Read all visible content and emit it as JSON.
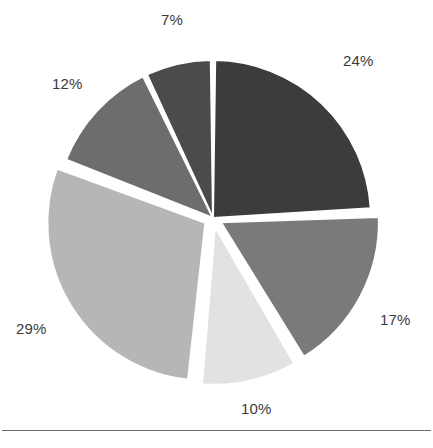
{
  "chart_data": {
    "type": "pie",
    "title": "",
    "subtitle": "",
    "xlabel": "",
    "ylabel": "",
    "legend_position": "none",
    "grid": false,
    "labels_shown": "percent",
    "categories": [
      "24%",
      "17%",
      "10%",
      "29%",
      "12%",
      "7%"
    ],
    "values": [
      24,
      17,
      10,
      29,
      12,
      7
    ],
    "total": 99,
    "start_angle_deg": 0,
    "direction": "clockwise",
    "slices": [
      {
        "index": 0,
        "label": "24%",
        "value": 24,
        "color": "#3c3c3c",
        "exploded": false,
        "start_deg": 0,
        "end_deg": 87.3,
        "label_x": 343,
        "label_y": 52
      },
      {
        "index": 1,
        "label": "17%",
        "value": 17,
        "color": "#7a7a7a",
        "exploded": true,
        "start_deg": 87.3,
        "end_deg": 149.1,
        "label_x": 380,
        "label_y": 311
      },
      {
        "index": 2,
        "label": "10%",
        "value": 10,
        "color": "#e2e2e2",
        "exploded": true,
        "start_deg": 149.1,
        "end_deg": 185.5,
        "label_x": 241,
        "label_y": 400
      },
      {
        "index": 3,
        "label": "29%",
        "value": 29,
        "color": "#b6b6b6",
        "exploded": true,
        "start_deg": 185.5,
        "end_deg": 290.9,
        "label_x": 16,
        "label_y": 320
      },
      {
        "index": 4,
        "label": "12%",
        "value": 12,
        "color": "#6d6d6d",
        "exploded": false,
        "start_deg": 290.9,
        "end_deg": 334.5,
        "label_x": 52,
        "label_y": 75
      },
      {
        "index": 5,
        "label": "7%",
        "value": 7,
        "color": "#4b4b4b",
        "exploded": false,
        "start_deg": 334.5,
        "end_deg": 360,
        "label_x": 161,
        "label_y": 11
      }
    ],
    "geometry": {
      "center_x": 213,
      "center_y": 218,
      "radius": 158,
      "explode_offset": 9,
      "gap_deg": 1.6
    },
    "colors": {
      "background": "#ffffff",
      "label_text": "#3b3b3b",
      "rule": "#6f6f6f"
    }
  }
}
